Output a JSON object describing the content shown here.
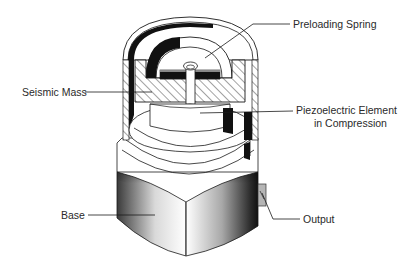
{
  "diagram": {
    "labels": {
      "preloading_spring": "Preloading Spring",
      "seismic_mass": "Seismic Mass",
      "piezo_line1": "Piezoelectric Element",
      "piezo_line2": "in Compression",
      "base": "Base",
      "output": "Output"
    },
    "colors": {
      "line": "#1a1a1a",
      "fill_white": "#ffffff",
      "fill_black": "#111111",
      "connector": "#b5b5b5"
    }
  }
}
